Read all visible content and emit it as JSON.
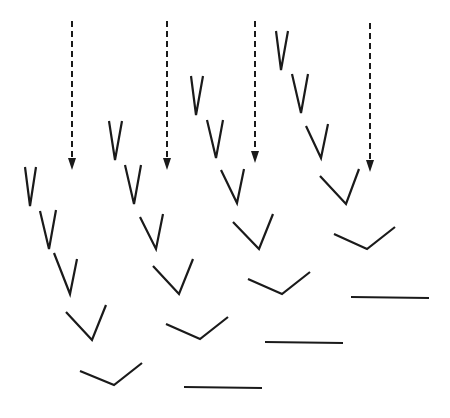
{
  "diagram": {
    "title": "",
    "stroke_color": "#1a1a1a",
    "background": "#ffffff",
    "arrows": [
      {
        "id": "arrow-1",
        "x": 72,
        "y1": 21,
        "y2": 170,
        "style": "dashed"
      },
      {
        "id": "arrow-2",
        "x": 167,
        "y1": 21,
        "y2": 170,
        "style": "dashed"
      },
      {
        "id": "arrow-3",
        "x": 255,
        "y1": 21,
        "y2": 163,
        "style": "dashed"
      },
      {
        "id": "arrow-4",
        "x": 370,
        "y1": 23,
        "y2": 172,
        "style": "dashed"
      }
    ],
    "sequences": [
      {
        "id": "sequence-1",
        "shapes": [
          {
            "type": "v",
            "points": [
              [
                25,
                167
              ],
              [
                30,
                206
              ],
              [
                36,
                167
              ]
            ]
          },
          {
            "type": "v",
            "points": [
              [
                40,
                211
              ],
              [
                49,
                249
              ],
              [
                56,
                210
              ]
            ]
          },
          {
            "type": "v",
            "points": [
              [
                54,
                253
              ],
              [
                70,
                294
              ],
              [
                77,
                259
              ]
            ]
          },
          {
            "type": "v",
            "points": [
              [
                66,
                312
              ],
              [
                92,
                340
              ],
              [
                106,
                305
              ]
            ]
          },
          {
            "type": "v",
            "points": [
              [
                80,
                371
              ],
              [
                114,
                385
              ],
              [
                142,
                363
              ]
            ]
          }
        ]
      },
      {
        "id": "sequence-2",
        "shapes": [
          {
            "type": "v",
            "points": [
              [
                109,
                121
              ],
              [
                115,
                160
              ],
              [
                122,
                121
              ]
            ]
          },
          {
            "type": "v",
            "points": [
              [
                125,
                165
              ],
              [
                134,
                204
              ],
              [
                141,
                165
              ]
            ]
          },
          {
            "type": "v",
            "points": [
              [
                140,
                217
              ],
              [
                156,
                249
              ],
              [
                163,
                214
              ]
            ]
          },
          {
            "type": "v",
            "points": [
              [
                153,
                266
              ],
              [
                179,
                294
              ],
              [
                193,
                259
              ]
            ]
          },
          {
            "type": "v",
            "points": [
              [
                166,
                324
              ],
              [
                200,
                339
              ],
              [
                228,
                317
              ]
            ]
          },
          {
            "type": "line",
            "points": [
              [
                184,
                387
              ],
              [
                262,
                388
              ]
            ]
          }
        ]
      },
      {
        "id": "sequence-3",
        "shapes": [
          {
            "type": "v",
            "points": [
              [
                191,
                76
              ],
              [
                196,
                115
              ],
              [
                203,
                76
              ]
            ]
          },
          {
            "type": "v",
            "points": [
              [
                207,
                120
              ],
              [
                216,
                158
              ],
              [
                223,
                120
              ]
            ]
          },
          {
            "type": "v",
            "points": [
              [
                221,
                170
              ],
              [
                237,
                203
              ],
              [
                244,
                169
              ]
            ]
          },
          {
            "type": "v",
            "points": [
              [
                233,
                222
              ],
              [
                259,
                249
              ],
              [
                273,
                214
              ]
            ]
          },
          {
            "type": "v",
            "points": [
              [
                248,
                279
              ],
              [
                282,
                294
              ],
              [
                310,
                272
              ]
            ]
          },
          {
            "type": "line",
            "points": [
              [
                265,
                342
              ],
              [
                343,
                343
              ]
            ]
          }
        ]
      },
      {
        "id": "sequence-4",
        "shapes": [
          {
            "type": "v",
            "points": [
              [
                276,
                31
              ],
              [
                281,
                70
              ],
              [
                288,
                31
              ]
            ]
          },
          {
            "type": "v",
            "points": [
              [
                292,
                74
              ],
              [
                301,
                113
              ],
              [
                308,
                74
              ]
            ]
          },
          {
            "type": "v",
            "points": [
              [
                306,
                126
              ],
              [
                321,
                158
              ],
              [
                328,
                124
              ]
            ]
          },
          {
            "type": "v",
            "points": [
              [
                320,
                176
              ],
              [
                346,
                204
              ],
              [
                359,
                169
              ]
            ]
          },
          {
            "type": "v",
            "points": [
              [
                334,
                234
              ],
              [
                367,
                249
              ],
              [
                395,
                227
              ]
            ]
          },
          {
            "type": "line",
            "points": [
              [
                351,
                297
              ],
              [
                429,
                298
              ]
            ]
          }
        ]
      }
    ]
  }
}
